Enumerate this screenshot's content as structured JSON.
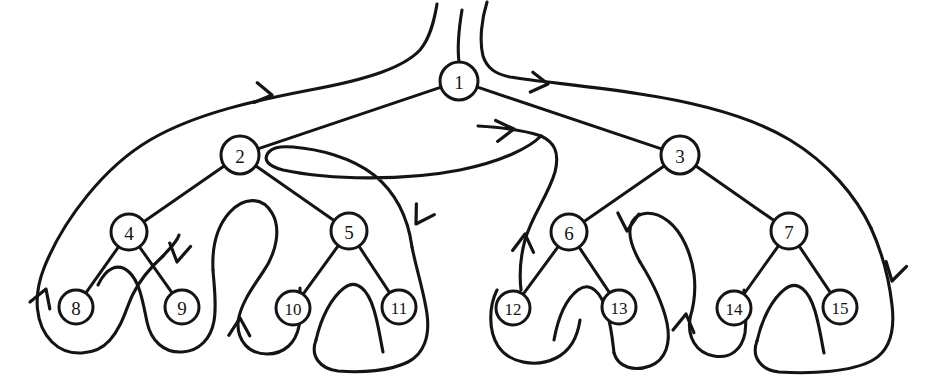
{
  "figure": {
    "kind": "binary-tree-euler-tour",
    "title": "",
    "caption": "",
    "background_color": "#ffffff",
    "ink_color": "#141414",
    "width": 931,
    "height": 378
  },
  "nodes": [
    {
      "id": 1,
      "label": "1",
      "cx": 459,
      "cy": 81,
      "r": 19,
      "level": 0
    },
    {
      "id": 2,
      "label": "2",
      "cx": 240,
      "cy": 155,
      "r": 19,
      "level": 1
    },
    {
      "id": 3,
      "label": "3",
      "cx": 680,
      "cy": 155,
      "r": 19,
      "level": 1
    },
    {
      "id": 4,
      "label": "4",
      "cx": 129,
      "cy": 232,
      "r": 18,
      "level": 2
    },
    {
      "id": 5,
      "label": "5",
      "cx": 349,
      "cy": 231,
      "r": 18,
      "level": 2
    },
    {
      "id": 6,
      "label": "6",
      "cx": 569,
      "cy": 232,
      "r": 18,
      "level": 2
    },
    {
      "id": 7,
      "label": "7",
      "cx": 789,
      "cy": 231,
      "r": 18,
      "level": 2
    },
    {
      "id": 8,
      "label": "8",
      "cx": 76,
      "cy": 307,
      "r": 17,
      "level": 3
    },
    {
      "id": 9,
      "label": "9",
      "cx": 182,
      "cy": 307,
      "r": 17,
      "level": 3
    },
    {
      "id": 10,
      "label": "10",
      "cx": 293,
      "cy": 308,
      "r": 17,
      "level": 3
    },
    {
      "id": 11,
      "label": "11",
      "cx": 399,
      "cy": 307,
      "r": 17,
      "level": 3
    },
    {
      "id": 12,
      "label": "12",
      "cx": 513,
      "cy": 308,
      "r": 17,
      "level": 3
    },
    {
      "id": 13,
      "label": "13",
      "cx": 619,
      "cy": 307,
      "r": 17,
      "level": 3
    },
    {
      "id": 14,
      "label": "14",
      "cx": 734,
      "cy": 308,
      "r": 17,
      "level": 3
    },
    {
      "id": 15,
      "label": "15",
      "cx": 840,
      "cy": 307,
      "r": 17,
      "level": 3
    }
  ],
  "edges": [
    {
      "from": 1,
      "to": 2
    },
    {
      "from": 1,
      "to": 3
    },
    {
      "from": 2,
      "to": 4
    },
    {
      "from": 2,
      "to": 5
    },
    {
      "from": 3,
      "to": 6
    },
    {
      "from": 3,
      "to": 7
    },
    {
      "from": 4,
      "to": 8
    },
    {
      "from": 4,
      "to": 9
    },
    {
      "from": 5,
      "to": 10
    },
    {
      "from": 5,
      "to": 11
    },
    {
      "from": 6,
      "to": 12
    },
    {
      "from": 6,
      "to": 13
    },
    {
      "from": 7,
      "to": 14
    },
    {
      "from": 7,
      "to": 15
    }
  ],
  "tour": {
    "description": "Euler tour traced counter-clockwise around the tree, entering at the root from above and exiting upward.",
    "arrows": [
      {
        "name": "arrow-root-to-left-subtree",
        "x": 272,
        "y": 95,
        "angle": 196
      },
      {
        "name": "arrow-left-outer-descend",
        "x": 45,
        "y": 288,
        "angle": 108
      },
      {
        "name": "arrow-left-inner-ascend",
        "x": 176,
        "y": 263,
        "angle": -76
      },
      {
        "name": "arrow-left-mid-descend",
        "x": 241,
        "y": 316,
        "angle": 96
      },
      {
        "name": "arrow-left-return-ascend",
        "x": 414,
        "y": 222,
        "angle": -50
      },
      {
        "name": "arrow-root-to-right-subtree",
        "x": 513,
        "y": 129,
        "angle": -8
      },
      {
        "name": "arrow-right-outer-descend",
        "x": 525,
        "y": 233,
        "angle": 97
      },
      {
        "name": "arrow-right-inner-ascend",
        "x": 625,
        "y": 232,
        "angle": -80
      },
      {
        "name": "arrow-right-mid-descend",
        "x": 684,
        "y": 312,
        "angle": 100
      },
      {
        "name": "arrow-right-return-ascend",
        "x": 891,
        "y": 279,
        "angle": -72
      },
      {
        "name": "arrow-right-to-root",
        "x": 547,
        "y": 83,
        "angle": 196
      }
    ]
  }
}
